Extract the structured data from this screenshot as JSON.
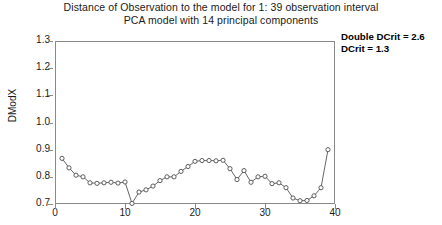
{
  "title": {
    "line1": "Distance of Observation to the model for 1: 39 observation interval",
    "line2": "PCA model with 14 principal components"
  },
  "annotation": {
    "double_dcrit": "Double DCrit = 2.6",
    "dcrit": "DCrit = 1.3"
  },
  "axis": {
    "y_title": "DModX",
    "y_ticks": [
      "1.3",
      "1.2",
      "1.1",
      "1.0",
      "0.9",
      "0.8",
      "0.7"
    ],
    "x_ticks": [
      "0",
      "10",
      "20",
      "30",
      "40"
    ]
  },
  "chart_data": {
    "type": "line",
    "title": "Distance of Observation to the model for 1: 39 observation interval",
    "subtitle": "PCA model with 14 principal components",
    "xlabel": "",
    "ylabel": "DModX",
    "xlim": [
      0,
      40
    ],
    "ylim": [
      0.7,
      1.3
    ],
    "ytick_values": [
      0.7,
      0.8,
      0.9,
      1.0,
      1.1,
      1.2,
      1.3
    ],
    "xtick_values": [
      0,
      10,
      20,
      30,
      40
    ],
    "grid": false,
    "legend": null,
    "markers": "open-circle",
    "annotations": [
      "Double DCrit = 2.6",
      "DCrit = 1.3"
    ],
    "x": [
      1,
      2,
      3,
      4,
      5,
      6,
      7,
      8,
      9,
      10,
      11,
      12,
      13,
      14,
      15,
      16,
      17,
      18,
      19,
      20,
      21,
      22,
      23,
      24,
      25,
      26,
      27,
      28,
      29,
      30,
      31,
      32,
      33,
      34,
      35,
      36,
      37,
      38,
      39
    ],
    "values": [
      0.868,
      0.833,
      0.806,
      0.8,
      0.778,
      0.776,
      0.778,
      0.78,
      0.777,
      0.781,
      0.702,
      0.744,
      0.752,
      0.766,
      0.786,
      0.8,
      0.8,
      0.82,
      0.838,
      0.857,
      0.86,
      0.86,
      0.859,
      0.861,
      0.83,
      0.79,
      0.823,
      0.78,
      0.8,
      0.802,
      0.775,
      0.778,
      0.76,
      0.722,
      0.712,
      0.713,
      0.73,
      0.76,
      0.9
    ]
  }
}
